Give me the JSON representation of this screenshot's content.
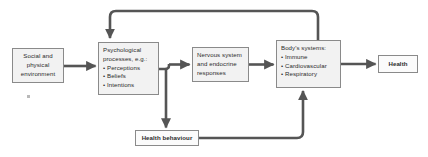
{
  "diagram": {
    "type": "flow-diagram",
    "background_color": "#ffffff",
    "connector_color": "#555555",
    "node_fill_color": "#f2f2f2",
    "node_border_color": "#8a8a8a",
    "nodes": {
      "social": {
        "id": "social-environment",
        "lines": [
          "Social and",
          "physical",
          "environment"
        ]
      },
      "psych": {
        "id": "psychological-processes",
        "heading_line_1": "Psychological",
        "heading_line_2": "processes, e.g.:",
        "bullets": [
          "• Perceptions",
          "• Beliefs",
          "• Intentions"
        ]
      },
      "nervous": {
        "id": "nervous-endocrine",
        "lines": [
          "Nervous system",
          "and endocrine",
          "responses"
        ]
      },
      "body": {
        "id": "body-systems",
        "heading": "Body's systems:",
        "bullets": [
          "• Immune",
          "• Cardiovascular",
          "• Respiratory"
        ]
      },
      "health": {
        "id": "health-outcome",
        "label": "Health"
      },
      "behaviour": {
        "id": "health-behaviour",
        "label": "Health behaviour"
      }
    },
    "connectors": [
      {
        "name": "social-to-psych",
        "from": "social",
        "to": "psych",
        "style": "straight-arrow",
        "direction": "right"
      },
      {
        "name": "psych-to-nervous",
        "from": "psych",
        "to": "nervous",
        "style": "straight-arrow",
        "direction": "right"
      },
      {
        "name": "nervous-to-body",
        "from": "nervous",
        "to": "body",
        "style": "straight-arrow",
        "direction": "right"
      },
      {
        "name": "body-to-health",
        "from": "body",
        "to": "health",
        "style": "straight-arrow",
        "direction": "right"
      },
      {
        "name": "psych-to-behaviour",
        "from": "psych",
        "to": "behaviour",
        "style": "elbow-arrow",
        "direction": "down"
      },
      {
        "name": "behaviour-to-body",
        "from": "behaviour",
        "to": "body",
        "style": "elbow-arrow",
        "direction": "up"
      },
      {
        "name": "body-to-psych-feedback",
        "from": "body",
        "to": "psych",
        "style": "elbow-arrow",
        "direction": "up-left-down"
      }
    ]
  }
}
